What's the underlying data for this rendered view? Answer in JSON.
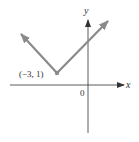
{
  "figure": {
    "x_axis_label": "x",
    "y_axis_label": "y",
    "origin_label": "0",
    "vertex_label": "(−3, 1)",
    "vertex": {
      "x": -3,
      "y": 1
    },
    "colors": {
      "graph": "#8a8a8a",
      "axes": "#333333"
    }
  }
}
